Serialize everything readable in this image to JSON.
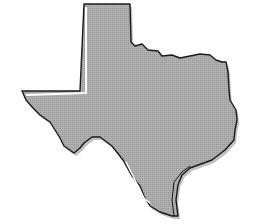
{
  "map": {
    "subject": "Texas",
    "shape": "state-silhouette",
    "colors": {
      "background": "#ffffff",
      "fill": "#a8a8a8",
      "outline": "#1a1a1a",
      "shadow": "#8c8c8c",
      "highlight": "#ffffff"
    }
  }
}
